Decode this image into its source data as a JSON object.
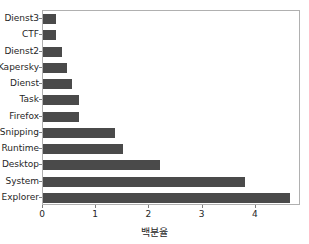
{
  "chart_data": {
    "type": "bar",
    "orientation": "horizontal",
    "title": "",
    "xlabel": "백분율",
    "ylabel": "",
    "categories": [
      "Explorer",
      "System",
      "Desktop",
      "Runtime",
      "Snipping",
      "Firefox",
      "Task",
      "Dienst",
      "Kapersky",
      "Dienst2",
      "CTF",
      "Dienst3"
    ],
    "values": [
      4.65,
      3.8,
      2.2,
      1.5,
      1.35,
      0.68,
      0.68,
      0.55,
      0.45,
      0.35,
      0.25,
      0.25
    ],
    "xlim": [
      0,
      4.85
    ],
    "xticks": [
      0,
      1,
      2,
      3,
      4
    ],
    "xtick_labels": [
      "0",
      "1",
      "2",
      "3",
      "4"
    ],
    "grid": false,
    "legend": null,
    "bar_color": "#4a4a4a",
    "axis_color": "#b0b0b0",
    "tick_color": "#7f7f7f",
    "text_color": "#262626"
  }
}
